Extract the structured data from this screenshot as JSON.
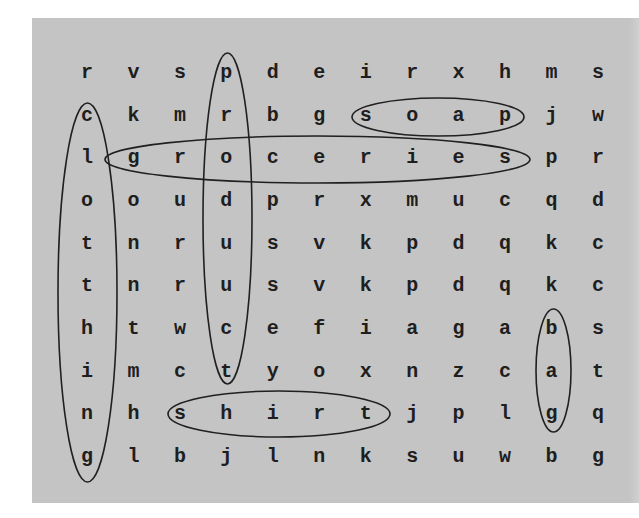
{
  "puzzle": {
    "rows": [
      [
        "r",
        "v",
        "s",
        "p",
        "d",
        "e",
        "i",
        "r",
        "x",
        "h",
        "m",
        "s"
      ],
      [
        "c",
        "k",
        "m",
        "r",
        "b",
        "g",
        "s",
        "o",
        "a",
        "p",
        "j",
        "w"
      ],
      [
        "l",
        "g",
        "r",
        "o",
        "c",
        "e",
        "r",
        "i",
        "e",
        "s",
        "p",
        "r"
      ],
      [
        "o",
        "o",
        "u",
        "d",
        "p",
        "r",
        "x",
        "m",
        "u",
        "c",
        "q",
        "d"
      ],
      [
        "t",
        "n",
        "r",
        "u",
        "s",
        "v",
        "k",
        "p",
        "d",
        "q",
        "k",
        "c"
      ],
      [
        "t",
        "n",
        "r",
        "u",
        "s",
        "v",
        "k",
        "p",
        "d",
        "q",
        "k",
        "c"
      ],
      [
        "h",
        "t",
        "w",
        "c",
        "e",
        "f",
        "i",
        "a",
        "g",
        "a",
        "b",
        "s"
      ],
      [
        "i",
        "m",
        "c",
        "t",
        "y",
        "o",
        "x",
        "n",
        "z",
        "c",
        "a",
        "t"
      ],
      [
        "n",
        "h",
        "s",
        "h",
        "i",
        "r",
        "t",
        "j",
        "p",
        "l",
        "g",
        "q"
      ],
      [
        "g",
        "l",
        "b",
        "j",
        "l",
        "n",
        "k",
        "s",
        "u",
        "w",
        "b",
        "g"
      ]
    ],
    "found_words": [
      {
        "word": "clothing",
        "direction": "vertical",
        "cells": [
          [
            1,
            0
          ],
          [
            2,
            0
          ],
          [
            3,
            0
          ],
          [
            4,
            0
          ],
          [
            5,
            0
          ],
          [
            6,
            0
          ],
          [
            7,
            0
          ],
          [
            8,
            0
          ],
          [
            9,
            0
          ]
        ]
      },
      {
        "word": "product",
        "direction": "vertical",
        "cells": [
          [
            0,
            3
          ],
          [
            1,
            3
          ],
          [
            2,
            3
          ],
          [
            3,
            3
          ],
          [
            4,
            3
          ],
          [
            5,
            3
          ],
          [
            6,
            3
          ],
          [
            7,
            3
          ]
        ]
      },
      {
        "word": "soap",
        "direction": "horizontal",
        "cells": [
          [
            1,
            6
          ],
          [
            1,
            7
          ],
          [
            1,
            8
          ],
          [
            1,
            9
          ]
        ]
      },
      {
        "word": "groceries",
        "direction": "horizontal",
        "cells": [
          [
            2,
            1
          ],
          [
            2,
            2
          ],
          [
            2,
            3
          ],
          [
            2,
            4
          ],
          [
            2,
            5
          ],
          [
            2,
            6
          ],
          [
            2,
            7
          ],
          [
            2,
            8
          ],
          [
            2,
            9
          ]
        ]
      },
      {
        "word": "shirt",
        "direction": "horizontal",
        "cells": [
          [
            8,
            2
          ],
          [
            8,
            3
          ],
          [
            8,
            4
          ],
          [
            8,
            5
          ],
          [
            8,
            6
          ]
        ]
      },
      {
        "word": "bag",
        "direction": "vertical",
        "cells": [
          [
            6,
            10
          ],
          [
            7,
            10
          ],
          [
            8,
            10
          ]
        ]
      }
    ],
    "colors": {
      "board": "#c4c4c4",
      "letters": "#1e1e1e",
      "outline": "#202020"
    }
  }
}
